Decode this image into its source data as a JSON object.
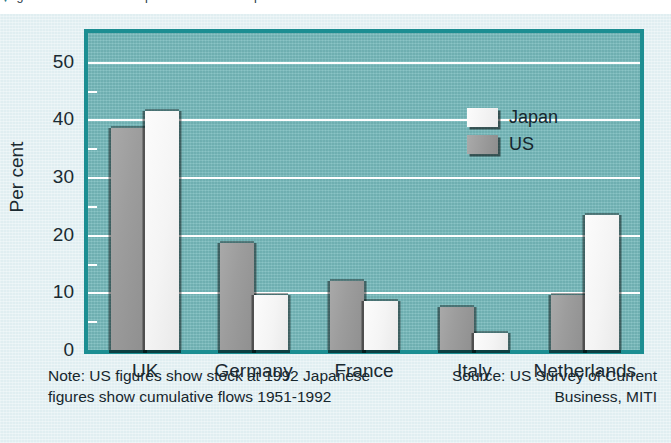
{
  "headline": {
    "bullet": "▼",
    "text": "Figure 1: Destination/recipients of US and Japanese investments in the EU"
  },
  "legend": {
    "position": "top-right-inside",
    "items": [
      {
        "label": "Japan",
        "swatch": "white-swatch",
        "color": "#f4f4f4"
      },
      {
        "label": "US",
        "swatch": "grey-swatch",
        "color": "#9a9a9a"
      }
    ]
  },
  "footnotes": {
    "note": "Note: US figures show stock at 1992 Japanese figures show cumulative flows 1951-1992",
    "source": "Source: US Survey of Current Business, MITI"
  },
  "colors": {
    "page_background": "#e4f0f3",
    "plot_background": "#74b8ba",
    "plot_border": "#1c8e92",
    "gridline": "#ffffff",
    "bar_japan": "#f4f4f4",
    "bar_us": "#9a9a9a",
    "text": "#16262d"
  },
  "chart_data": {
    "type": "bar",
    "title": "Destination/recipients of US and Japanese investments in the EU",
    "xlabel": "",
    "ylabel": "Per cent",
    "ylim": [
      0,
      55
    ],
    "yticks": [
      0,
      10,
      20,
      30,
      40,
      50
    ],
    "ytick_labels": [
      "0",
      "10",
      "20",
      "30",
      "40",
      "50"
    ],
    "grid": true,
    "grid_axis": "y",
    "legend_position": "upper right",
    "categories": [
      "UK",
      "Germany",
      "France",
      "Italy",
      "Netherlands"
    ],
    "series": [
      {
        "name": "US",
        "color": "#9a9a9a",
        "values": [
          38.5,
          18.5,
          12.0,
          7.5,
          9.5
        ]
      },
      {
        "name": "Japan",
        "color": "#f4f4f4",
        "values": [
          41.5,
          9.5,
          8.5,
          3.0,
          23.5
        ]
      }
    ],
    "notes": [
      "Note: US figures show stock at 1992 Japanese figures show cumulative flows 1951-1992",
      "Source: US Survey of Current Business, MITI"
    ]
  }
}
